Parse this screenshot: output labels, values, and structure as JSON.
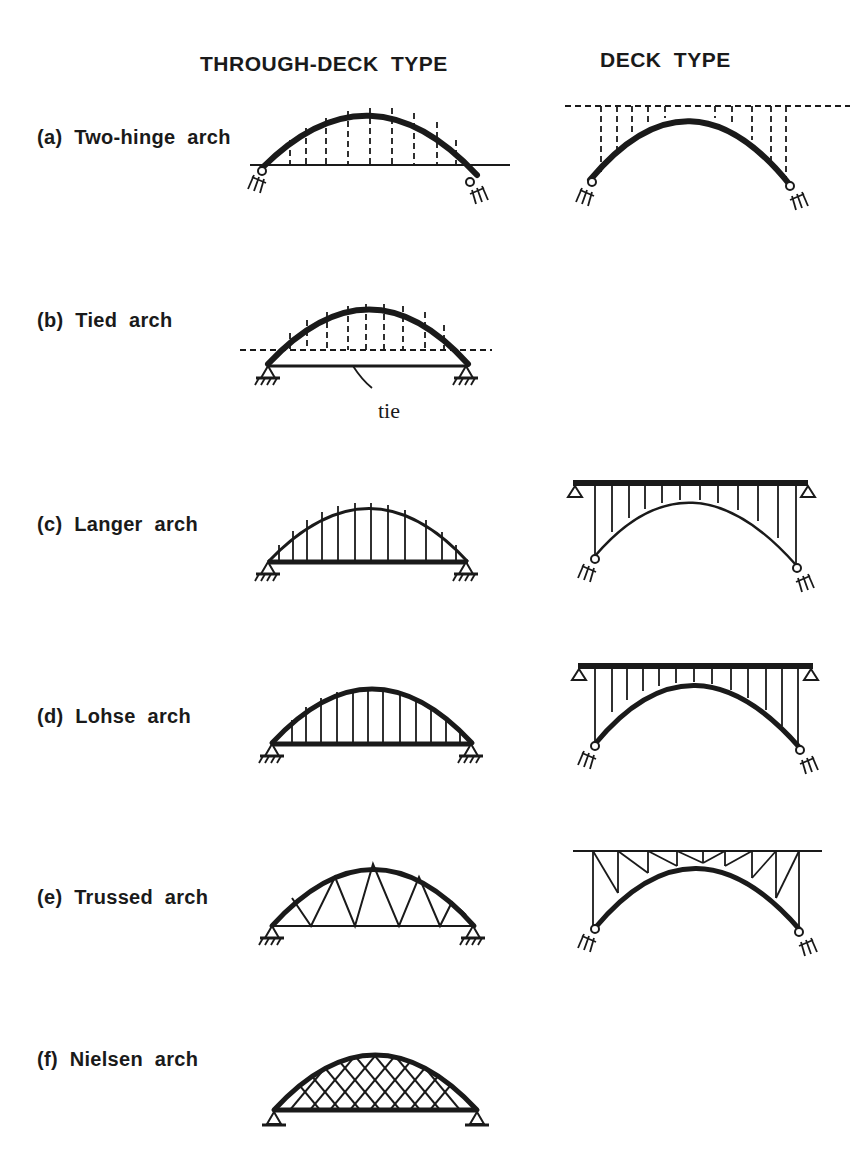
{
  "headers": {
    "through_deck": "THROUGH-DECK TYPE",
    "deck": "DECK TYPE"
  },
  "rows": [
    {
      "id": "a",
      "label": "(a) Two-hinge arch",
      "through_deck": "two-hinged arch, dashed hangers to dashed deck line",
      "deck": "two-hinged arch under dashed deck, dashed columns"
    },
    {
      "id": "b",
      "label": "(b) Tied arch",
      "through_deck": "tied arch with dashed hangers and dashed deck line",
      "deck": null,
      "annotation": "tie"
    },
    {
      "id": "c",
      "label": "(c) Langer arch",
      "through_deck": "thin arch rib, stiff girder, vertical hangers",
      "deck": "thin arch rib, stiff deck girder, vertical columns"
    },
    {
      "id": "d",
      "label": "(d) Lohse arch",
      "through_deck": "stiff arch rib and stiff girder, vertical hangers",
      "deck": "stiff arch rib and stiff deck girder, vertical columns"
    },
    {
      "id": "e",
      "label": "(e) Trussed arch",
      "through_deck": "arch with triangulated (Warren) web",
      "deck": "arch with trussed spandrel web"
    },
    {
      "id": "f",
      "label": "(f) Nielsen arch",
      "through_deck": "arch with crossing inclined hangers (network)",
      "deck": null
    }
  ],
  "colors": {
    "ink": "#1a1a1a",
    "background": "#ffffff"
  }
}
